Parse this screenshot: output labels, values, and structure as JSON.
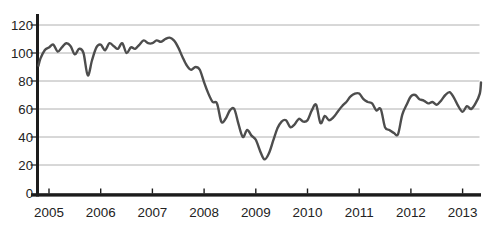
{
  "figure": {
    "background": "#ffffff"
  },
  "chart_data": {
    "type": "line",
    "title": "",
    "xlabel": "",
    "ylabel": "",
    "legend": "none",
    "grid": "horizontal",
    "ylim": [
      0,
      120
    ],
    "xlim": [
      2004.75,
      2013.45
    ],
    "y_ticks": [
      0,
      20,
      40,
      60,
      80,
      100,
      120
    ],
    "x_tick_years": [
      2005,
      2006,
      2007,
      2008,
      2009,
      2010,
      2011,
      2012,
      2013
    ],
    "x_tick_labels": [
      "2005",
      "2006",
      "2007",
      "2008",
      "2009",
      "2010",
      "2011",
      "2012",
      "2013"
    ],
    "colors": {
      "line": "#4d4d4d",
      "grid": "#b0b0b0",
      "axis": "#1c1c1c",
      "tick_text": "#222222"
    },
    "series": [
      {
        "name": "index",
        "x_start_year": 2004.75,
        "x_step_years": 0.083333,
        "values": [
          91,
          96,
          102,
          104,
          106,
          101,
          104,
          107,
          105,
          99,
          103,
          100,
          84,
          95,
          104,
          106,
          102,
          107,
          105,
          103,
          107,
          100,
          104,
          103,
          106,
          109,
          107,
          107,
          109,
          108,
          110,
          111,
          109,
          104,
          97,
          91,
          88,
          90,
          88,
          79,
          71,
          65,
          64,
          51,
          53,
          59,
          60,
          49,
          40,
          45,
          41,
          38,
          30,
          24,
          28,
          37,
          46,
          51,
          52,
          47,
          49,
          53,
          51,
          52,
          59,
          63,
          50,
          55,
          52,
          54,
          58,
          62,
          65,
          69,
          71,
          71,
          67,
          65,
          64,
          59,
          60,
          47,
          45,
          43,
          42,
          56,
          63,
          69,
          70,
          67,
          66,
          64,
          65,
          63,
          66,
          70,
          72,
          68,
          62,
          58,
          62,
          60,
          64,
          71,
          79
        ]
      }
    ]
  }
}
